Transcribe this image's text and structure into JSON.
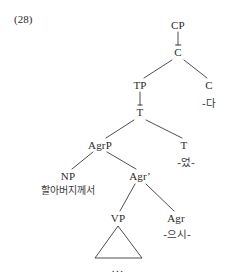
{
  "figure": {
    "example_number": "(28)",
    "caption_ellipsis": "...",
    "ink_color": "#3a3a3a",
    "background_color": "#ffffff"
  },
  "tree": {
    "nodes": [
      {
        "id": "CP",
        "label": "CP",
        "x": 178,
        "y": 25,
        "bar": false
      },
      {
        "id": "Cbar",
        "label": "C",
        "x": 178,
        "y": 52,
        "bar": true
      },
      {
        "id": "TP",
        "label": "TP",
        "x": 140,
        "y": 85,
        "bar": false
      },
      {
        "id": "C",
        "label": "C",
        "x": 209,
        "y": 85,
        "bar": false
      },
      {
        "id": "Tbar",
        "label": "T",
        "x": 140,
        "y": 112,
        "bar": true
      },
      {
        "id": "AgrP",
        "label": "AgrP",
        "x": 100,
        "y": 145,
        "bar": false
      },
      {
        "id": "T",
        "label": "T",
        "x": 184,
        "y": 145,
        "bar": false
      },
      {
        "id": "NP",
        "label": "NP",
        "x": 68,
        "y": 176,
        "bar": false
      },
      {
        "id": "Agrbar",
        "label": "Agr",
        "x": 140,
        "y": 176,
        "bar": false,
        "prime": "’"
      },
      {
        "id": "VP",
        "label": "VP",
        "x": 118,
        "y": 218,
        "bar": false
      },
      {
        "id": "Agr",
        "label": "Agr",
        "x": 176,
        "y": 218,
        "bar": false
      }
    ],
    "edges": [
      {
        "from": "CP",
        "to": "Cbar",
        "x1": 178,
        "y1": 32,
        "x2": 178,
        "y2": 45
      },
      {
        "from": "Cbar",
        "to": "TP",
        "x1": 172,
        "y1": 60,
        "x2": 144,
        "y2": 78
      },
      {
        "from": "Cbar",
        "to": "C",
        "x1": 184,
        "y1": 60,
        "x2": 207,
        "y2": 78
      },
      {
        "from": "TP",
        "to": "Tbar",
        "x1": 140,
        "y1": 92,
        "x2": 140,
        "y2": 105
      },
      {
        "from": "Tbar",
        "to": "AgrP",
        "x1": 134,
        "y1": 120,
        "x2": 106,
        "y2": 138
      },
      {
        "from": "Tbar",
        "to": "T",
        "x1": 146,
        "y1": 120,
        "x2": 182,
        "y2": 138
      },
      {
        "from": "AgrP",
        "to": "NP",
        "x1": 93,
        "y1": 152,
        "x2": 72,
        "y2": 169
      },
      {
        "from": "AgrP",
        "to": "Agrbar",
        "x1": 107,
        "y1": 152,
        "x2": 136,
        "y2": 169
      },
      {
        "from": "Agrbar",
        "to": "VP",
        "x1": 135,
        "y1": 184,
        "x2": 120,
        "y2": 211
      },
      {
        "from": "Agrbar",
        "to": "Agr",
        "x1": 146,
        "y1": 184,
        "x2": 174,
        "y2": 211
      }
    ],
    "terminals": [
      {
        "id": "c-morpheme",
        "parent": "C",
        "text": "-다",
        "x": 209,
        "y": 103
      },
      {
        "id": "t-morpheme",
        "parent": "T",
        "text": "-었-",
        "x": 186,
        "y": 162
      },
      {
        "id": "np-phrase",
        "parent": "NP",
        "text": "할아버지께서",
        "x": 68,
        "y": 191
      },
      {
        "id": "agr-morpheme",
        "parent": "Agr",
        "text": "-으시-",
        "x": 177,
        "y": 234
      }
    ],
    "triangle": {
      "id": "vp-triangle",
      "apex_x": 118,
      "apex_y": 226,
      "left_x": 95,
      "left_y": 258,
      "right_x": 142,
      "right_y": 258,
      "ellipsis_x": 118,
      "ellipsis_y": 268
    }
  }
}
